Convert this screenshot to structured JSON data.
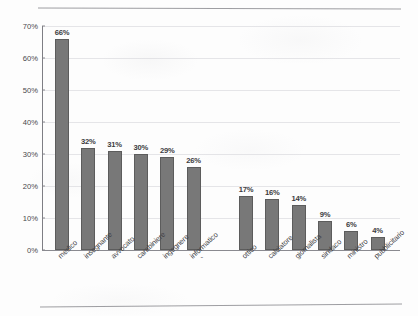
{
  "chart_data": {
    "type": "bar",
    "title": "",
    "xlabel": "",
    "ylabel": "",
    "ylim": [
      0,
      70
    ],
    "yticks": [
      "0%",
      "10%",
      "20%",
      "30%",
      "40%",
      "50%",
      "60%",
      "70%"
    ],
    "ytick_values": [
      0,
      10,
      20,
      30,
      40,
      50,
      60,
      70
    ],
    "grid": true,
    "legend": "none",
    "categories": [
      "medico",
      "insegnante",
      "avvocato",
      "carabiniere",
      "ingegnere",
      "informatico",
      "ottico",
      "calciatore",
      "giornalista",
      "sindaco",
      "ministro",
      "pubblicitario"
    ],
    "values": [
      66,
      32,
      31,
      30,
      29,
      26,
      17,
      16,
      14,
      9,
      6,
      4
    ],
    "value_labels": [
      "66%",
      "32%",
      "31%",
      "30%",
      "29%",
      "26%",
      "17%",
      "16%",
      "14%",
      "9%",
      "6%",
      "4%"
    ],
    "bar_color": "#787878",
    "bar_edge_color": "#5c5c5c",
    "gridline_color": "#dcdce0",
    "axis_color": "#8a8a90",
    "annotations": [
      {
        "text": "-",
        "near_category": "informatico"
      }
    ]
  },
  "figure": {
    "rule_color": "#8d8d92",
    "background": "#fdfdfd"
  }
}
